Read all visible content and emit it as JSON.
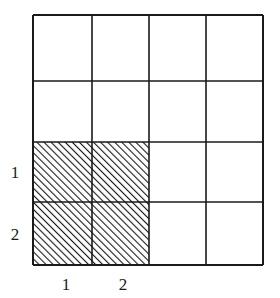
{
  "diagram": {
    "type": "grid-shaded-region",
    "grid": {
      "rows": 4,
      "cols": 4,
      "left": 33,
      "top": 15,
      "right": 263,
      "bottom": 265,
      "col_lines": [
        33,
        92,
        149,
        206,
        263
      ],
      "row_lines": [
        15,
        81,
        142,
        202,
        265
      ],
      "line_color": "#1a1a1a"
    },
    "shaded_region": {
      "rows": [
        2,
        3
      ],
      "cols": [
        0,
        1
      ],
      "pattern": "diagonal-hatch",
      "hatch_color": "#1a1a1a",
      "hatch_spacing": 5
    },
    "row_labels": [
      {
        "text": "1",
        "x": 15,
        "y": 172
      },
      {
        "text": "2",
        "x": 15,
        "y": 234
      }
    ],
    "col_labels": [
      {
        "text": "1",
        "x": 66,
        "y": 284
      },
      {
        "text": "2",
        "x": 123,
        "y": 284
      }
    ]
  }
}
